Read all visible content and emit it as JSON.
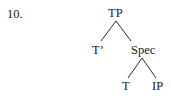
{
  "example_number": "10.",
  "tree": {
    "root": {
      "label": "TP"
    },
    "left_child": {
      "label": "T’"
    },
    "right_child": {
      "label": "Spec"
    },
    "right_left_child": {
      "label": "T"
    },
    "right_right_child": {
      "label": "IP"
    }
  }
}
